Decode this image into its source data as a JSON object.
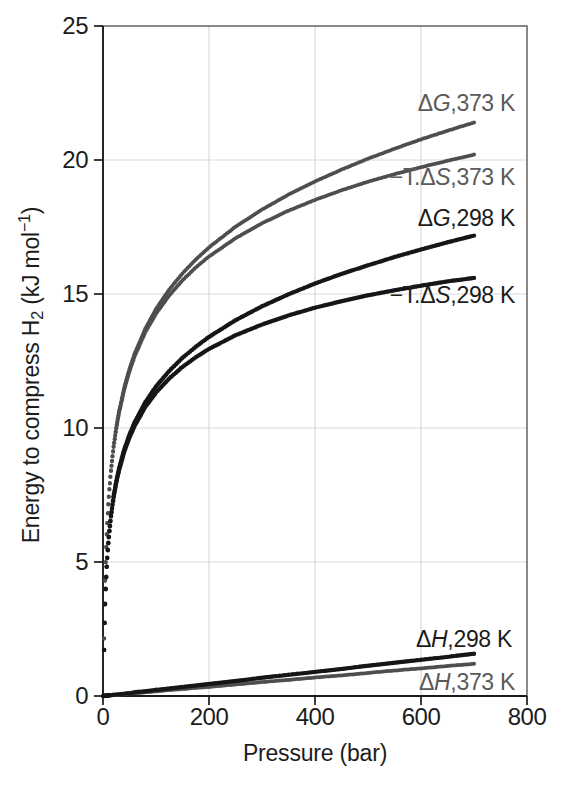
{
  "page": {
    "background": "#ffffff"
  },
  "colors": {
    "black_series": "#161616",
    "gray_series": "#4e4e4e",
    "black_label": "#1c1c1c",
    "gray_label": "#5a5a5a",
    "grid": "#d9d9d9",
    "frame": "#4a4a4a",
    "axis": "#1b1b1b"
  },
  "chart_data": {
    "type": "scatter",
    "title": "",
    "xlabel": "Pressure (bar)",
    "ylabel": "Energy to compress H2 (kJ mol-1)",
    "ylabel_parts": {
      "t1": "Energy to compress H",
      "sub": "2",
      "t2": " (kJ mol",
      "sup": "−1",
      "t3": ")"
    },
    "xlim": [
      0,
      800
    ],
    "ylim": [
      0,
      25
    ],
    "x_ticks": [
      0,
      200,
      400,
      600,
      800
    ],
    "y_ticks": [
      0,
      5,
      10,
      15,
      20,
      25
    ],
    "grid": true,
    "legend": "inline curve annotations at right of each curve",
    "marker_style": "dense small dots (scatter markers forming curves)",
    "pressures": [
      1,
      2,
      3,
      4,
      5,
      6,
      7,
      8,
      9,
      10,
      12,
      15,
      20,
      25,
      30,
      40,
      50,
      60,
      80,
      100,
      125,
      150,
      175,
      200,
      250,
      300,
      350,
      400,
      450,
      500,
      550,
      600,
      650,
      700
    ],
    "series": [
      {
        "name": "delta-G-373K",
        "label": {
          "pre": "Δ",
          "sym": "G",
          "suf": ",373 K"
        },
        "temperature_K": 373,
        "color": "#4e4e4e",
        "values": [
          0,
          2.15,
          3.41,
          4.31,
          5.0,
          5.57,
          6.04,
          6.46,
          6.83,
          7.16,
          7.72,
          8.42,
          9.32,
          10.02,
          10.59,
          11.5,
          12.21,
          12.79,
          13.71,
          14.44,
          15.17,
          15.77,
          16.29,
          16.74,
          17.51,
          18.15,
          18.71,
          19.2,
          19.64,
          20.05,
          20.42,
          20.77,
          21.09,
          21.4
        ]
      },
      {
        "name": "minus-T-delta-S-373K",
        "label": {
          "pre": "−T.Δ",
          "sym": "S",
          "suf": ",373 K"
        },
        "temperature_K": 373,
        "color": "#4e4e4e",
        "values": [
          0,
          2.15,
          3.41,
          4.3,
          4.99,
          5.55,
          6.03,
          6.45,
          6.81,
          7.14,
          7.7,
          8.4,
          9.29,
          9.98,
          10.54,
          11.43,
          12.12,
          12.69,
          13.58,
          14.26,
          14.95,
          15.51,
          15.99,
          16.4,
          17.08,
          17.64,
          18.11,
          18.51,
          18.87,
          19.19,
          19.47,
          19.73,
          19.97,
          20.2
        ]
      },
      {
        "name": "delta-H-373K",
        "label": {
          "pre": "Δ",
          "sym": "H",
          "suf": ",373 K"
        },
        "temperature_K": 373,
        "color": "#4e4e4e",
        "values": [
          0,
          0,
          0.01,
          0.01,
          0.01,
          0.01,
          0.01,
          0.01,
          0.02,
          0.02,
          0.02,
          0.03,
          0.03,
          0.04,
          0.05,
          0.07,
          0.09,
          0.1,
          0.14,
          0.17,
          0.22,
          0.26,
          0.3,
          0.34,
          0.43,
          0.52,
          0.6,
          0.69,
          0.77,
          0.86,
          0.95,
          1.03,
          1.12,
          1.2
        ]
      },
      {
        "name": "delta-G-298K",
        "label": {
          "pre": "Δ",
          "sym": "G",
          "suf": ",298 K"
        },
        "temperature_K": 298,
        "color": "#161616",
        "values": [
          0,
          1.72,
          2.73,
          3.44,
          4.0,
          4.45,
          4.83,
          5.16,
          5.46,
          5.72,
          6.17,
          6.73,
          7.45,
          8.01,
          8.47,
          9.2,
          9.76,
          10.23,
          10.97,
          11.55,
          12.13,
          12.62,
          13.03,
          13.4,
          14.02,
          14.54,
          14.99,
          15.39,
          15.75,
          16.07,
          16.38,
          16.66,
          16.93,
          17.18
        ]
      },
      {
        "name": "minus-T-delta-S-298K",
        "label": {
          "pre": "−T.Δ",
          "sym": "S",
          "suf": ",298 K"
        },
        "temperature_K": 298,
        "color": "#161616",
        "values": [
          0,
          1.72,
          2.72,
          3.43,
          3.98,
          4.43,
          4.82,
          5.15,
          5.44,
          5.7,
          6.15,
          6.7,
          7.41,
          7.95,
          8.4,
          9.11,
          9.65,
          10.09,
          10.79,
          11.32,
          11.85,
          12.28,
          12.64,
          12.95,
          13.46,
          13.86,
          14.2,
          14.49,
          14.73,
          14.95,
          15.14,
          15.31,
          15.47,
          15.6
        ]
      },
      {
        "name": "delta-H-298K",
        "label": {
          "pre": "Δ",
          "sym": "H",
          "suf": ",298 K"
        },
        "temperature_K": 298,
        "color": "#161616",
        "values": [
          0,
          0,
          0.01,
          0.01,
          0.01,
          0.01,
          0.02,
          0.02,
          0.02,
          0.02,
          0.03,
          0.03,
          0.05,
          0.06,
          0.07,
          0.09,
          0.11,
          0.14,
          0.18,
          0.23,
          0.28,
          0.34,
          0.39,
          0.45,
          0.56,
          0.68,
          0.79,
          0.9,
          1.01,
          1.13,
          1.24,
          1.35,
          1.46,
          1.58
        ]
      }
    ]
  }
}
